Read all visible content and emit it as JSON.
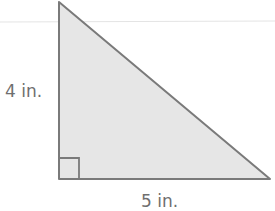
{
  "diagram": {
    "shape": "right-triangle",
    "height_label": "4 in.",
    "base_label": "5 in.",
    "colors": {
      "fill": "#e6e6e6",
      "stroke": "#7a7a7a",
      "text": "#6f6f6f",
      "guide_line": "#e4e4e4"
    }
  }
}
